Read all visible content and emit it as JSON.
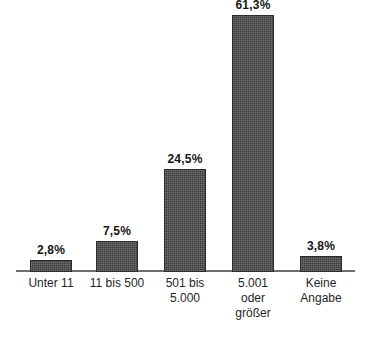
{
  "chart_data": {
    "type": "bar",
    "title": "",
    "subtitle": "",
    "xlabel": "",
    "ylabel": "",
    "categories": [
      "Unter 11",
      "11 bis 500",
      "501 bis 5.000",
      "5.001 oder größer",
      "Keine Angabe"
    ],
    "category_lines": [
      [
        "Unter 11"
      ],
      [
        "11 bis 500"
      ],
      [
        "501 bis",
        "5.000"
      ],
      [
        "5.001",
        "oder",
        "größer"
      ],
      [
        "Keine",
        "Angabe"
      ]
    ],
    "values": [
      2.8,
      7.5,
      24.5,
      61.3,
      3.8
    ],
    "value_labels": [
      "2,8%",
      "7,5%",
      "24,5%",
      "61,3%",
      "3,8%"
    ],
    "ylim": [
      0,
      64.5
    ],
    "grid": false,
    "legend": false,
    "legend_position": "none",
    "units": "%",
    "bar_color": "#3a3a3a",
    "axis_color": "#6f6f6f",
    "text_color": "#1a1a1a",
    "background_color": "#ffffff"
  }
}
